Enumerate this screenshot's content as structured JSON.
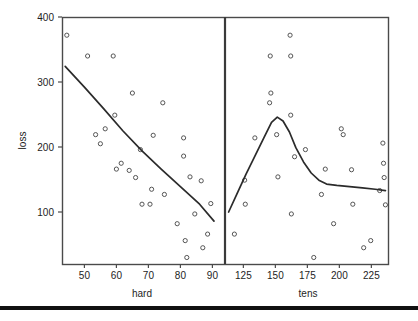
{
  "figure": {
    "background": "#ffffff",
    "panel_border_color": "#4a4a4a",
    "point_color": "#555555",
    "line_color": "#2b2b2b",
    "divider_color": "#3a3a3a",
    "bottom_bar_color": "#111111"
  },
  "axes": {
    "y_label": "loss",
    "y_ticks": [
      100,
      200,
      300,
      400
    ],
    "y_range": [
      20,
      400
    ],
    "left_panel": {
      "x_label": "hard",
      "x_ticks": [
        50,
        60,
        70,
        80,
        90
      ],
      "x_range": [
        43,
        93
      ]
    },
    "right_panel": {
      "x_label": "tens",
      "x_ticks": [
        125,
        150,
        175,
        200,
        225
      ],
      "x_range": [
        113,
        238
      ]
    }
  },
  "chart_data": {
    "type": "scatter",
    "title": "",
    "ylabel": "loss",
    "grid": false,
    "legend": null,
    "panels": [
      {
        "name": "hard",
        "xlabel": "hard",
        "xlim": [
          43,
          93
        ],
        "ylim": [
          20,
          400
        ],
        "xticks": [
          50,
          60,
          70,
          80,
          90
        ],
        "yticks": [
          100,
          200,
          300,
          400
        ],
        "points": [
          {
            "x": 44.5,
            "y": 372
          },
          {
            "x": 51.0,
            "y": 340
          },
          {
            "x": 53.5,
            "y": 219
          },
          {
            "x": 55.0,
            "y": 205
          },
          {
            "x": 56.5,
            "y": 228
          },
          {
            "x": 59.0,
            "y": 340
          },
          {
            "x": 59.5,
            "y": 249
          },
          {
            "x": 60.0,
            "y": 166
          },
          {
            "x": 61.5,
            "y": 175
          },
          {
            "x": 64.0,
            "y": 164
          },
          {
            "x": 65.0,
            "y": 283
          },
          {
            "x": 66.0,
            "y": 153
          },
          {
            "x": 67.5,
            "y": 196
          },
          {
            "x": 68.0,
            "y": 112
          },
          {
            "x": 70.5,
            "y": 112
          },
          {
            "x": 71.0,
            "y": 135
          },
          {
            "x": 71.5,
            "y": 218
          },
          {
            "x": 74.5,
            "y": 268
          },
          {
            "x": 75.0,
            "y": 127
          },
          {
            "x": 79.0,
            "y": 82
          },
          {
            "x": 81.0,
            "y": 214
          },
          {
            "x": 81.0,
            "y": 186
          },
          {
            "x": 81.5,
            "y": 56
          },
          {
            "x": 82.0,
            "y": 30
          },
          {
            "x": 83.0,
            "y": 154
          },
          {
            "x": 84.5,
            "y": 97
          },
          {
            "x": 86.5,
            "y": 148
          },
          {
            "x": 87.0,
            "y": 45
          },
          {
            "x": 88.5,
            "y": 66
          },
          {
            "x": 89.5,
            "y": 113
          }
        ],
        "smooth_line": [
          {
            "x": 44.0,
            "y": 324
          },
          {
            "x": 50.0,
            "y": 292
          },
          {
            "x": 56.0,
            "y": 259
          },
          {
            "x": 62.0,
            "y": 225
          },
          {
            "x": 68.0,
            "y": 194
          },
          {
            "x": 74.0,
            "y": 166
          },
          {
            "x": 80.0,
            "y": 139
          },
          {
            "x": 86.0,
            "y": 112
          },
          {
            "x": 90.5,
            "y": 86
          }
        ]
      },
      {
        "name": "tens",
        "xlabel": "tens",
        "xlim": [
          113,
          238
        ],
        "ylim": [
          20,
          400
        ],
        "xticks": [
          125,
          150,
          175,
          200,
          225
        ],
        "yticks": [
          100,
          200,
          300,
          400
        ],
        "points": [
          {
            "x": 118.0,
            "y": 66
          },
          {
            "x": 126.0,
            "y": 149
          },
          {
            "x": 126.5,
            "y": 112
          },
          {
            "x": 134.0,
            "y": 214
          },
          {
            "x": 146.0,
            "y": 340
          },
          {
            "x": 146.5,
            "y": 283
          },
          {
            "x": 145.5,
            "y": 268
          },
          {
            "x": 151.0,
            "y": 219
          },
          {
            "x": 152.0,
            "y": 154
          },
          {
            "x": 161.5,
            "y": 372
          },
          {
            "x": 162.0,
            "y": 340
          },
          {
            "x": 162.0,
            "y": 249
          },
          {
            "x": 162.5,
            "y": 97
          },
          {
            "x": 165.0,
            "y": 185
          },
          {
            "x": 173.5,
            "y": 196
          },
          {
            "x": 180.0,
            "y": 30
          },
          {
            "x": 186.0,
            "y": 127
          },
          {
            "x": 189.0,
            "y": 166
          },
          {
            "x": 195.5,
            "y": 82
          },
          {
            "x": 201.5,
            "y": 228
          },
          {
            "x": 203.0,
            "y": 219
          },
          {
            "x": 209.5,
            "y": 165
          },
          {
            "x": 210.5,
            "y": 112
          },
          {
            "x": 219.0,
            "y": 45
          },
          {
            "x": 224.5,
            "y": 56
          },
          {
            "x": 231.5,
            "y": 133
          },
          {
            "x": 234.0,
            "y": 206
          },
          {
            "x": 234.5,
            "y": 175
          },
          {
            "x": 235.0,
            "y": 153
          },
          {
            "x": 236.0,
            "y": 111
          }
        ],
        "smooth_line": [
          {
            "x": 113.5,
            "y": 100
          },
          {
            "x": 120.0,
            "y": 128
          },
          {
            "x": 127.0,
            "y": 158
          },
          {
            "x": 134.0,
            "y": 186
          },
          {
            "x": 141.0,
            "y": 214
          },
          {
            "x": 147.0,
            "y": 238
          },
          {
            "x": 151.5,
            "y": 246
          },
          {
            "x": 156.0,
            "y": 240
          },
          {
            "x": 161.0,
            "y": 223
          },
          {
            "x": 166.0,
            "y": 199
          },
          {
            "x": 172.0,
            "y": 177
          },
          {
            "x": 178.0,
            "y": 160
          },
          {
            "x": 184.0,
            "y": 149
          },
          {
            "x": 190.0,
            "y": 143
          },
          {
            "x": 198.0,
            "y": 141
          },
          {
            "x": 208.0,
            "y": 139
          },
          {
            "x": 218.0,
            "y": 137
          },
          {
            "x": 228.0,
            "y": 135
          },
          {
            "x": 236.0,
            "y": 133
          }
        ]
      }
    ]
  }
}
